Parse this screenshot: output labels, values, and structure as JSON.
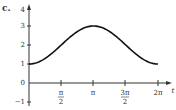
{
  "panel_label": "c.",
  "chart_data": {
    "type": "line",
    "title": "",
    "xlabel": "t",
    "ylabel": "",
    "function": "2 - cos(t)",
    "x_ticks": [
      "π/2",
      "π",
      "3π/2",
      "2π"
    ],
    "y_ticks": [
      "-1",
      "0",
      "1",
      "2",
      "3",
      "4"
    ],
    "xlim": [
      0,
      6.2832
    ],
    "ylim": [
      -1,
      4
    ],
    "x": [
      0,
      0.7854,
      1.5708,
      2.3562,
      3.1416,
      3.927,
      4.7124,
      5.4978,
      6.2832
    ],
    "series": [
      {
        "name": "curve",
        "values": [
          1,
          1.29,
          2,
          2.71,
          3,
          2.71,
          2,
          1.29,
          1
        ]
      }
    ],
    "grid": false,
    "legend": "none"
  },
  "labels": {
    "x_pi_2_num": "π",
    "x_pi_2_den": "2",
    "x_pi": "π",
    "x_3pi_2_num": "3π",
    "x_3pi_2_den": "2",
    "x_2pi": "2π",
    "t": "t",
    "y4": "4",
    "y3": "3",
    "y2": "2",
    "y1": "1",
    "y0": "0",
    "ym1": "−1"
  }
}
